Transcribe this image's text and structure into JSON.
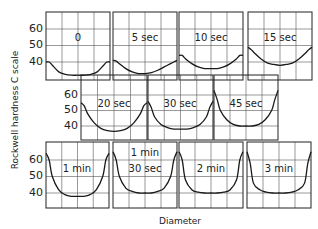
{
  "chart_data": {
    "type": "line",
    "title": "",
    "xlabel": "Diameter",
    "ylabel": "Rockwell hardness C scale",
    "y_ticks": [
      40,
      50,
      60
    ],
    "ylim": [
      30,
      70
    ],
    "grid": true,
    "x": [
      0,
      0.05,
      0.1,
      0.2,
      0.3,
      0.4,
      0.5,
      0.6,
      0.7,
      0.8,
      0.9,
      0.95,
      1.0
    ],
    "panels": [
      {
        "label": "0",
        "row": 0,
        "values": [
          40,
          40,
          38,
          34,
          32.5,
          32,
          32,
          32,
          32.5,
          34,
          38,
          40,
          40
        ]
      },
      {
        "label": "5 sec",
        "row": 0,
        "values": [
          41,
          40.5,
          39,
          36,
          34,
          33,
          33,
          33.5,
          35,
          37,
          39,
          40,
          41
        ]
      },
      {
        "label": "10 sec",
        "row": 0,
        "values": [
          44,
          44,
          42,
          39,
          37,
          36,
          36,
          36,
          37,
          39,
          42,
          44,
          44
        ]
      },
      {
        "label": "15 sec",
        "row": 0,
        "values": [
          49,
          47.5,
          45.5,
          42,
          39.5,
          38.5,
          38,
          38.5,
          39.5,
          42,
          45.5,
          47.5,
          49
        ]
      },
      {
        "label": "20 sec",
        "row": 1,
        "values": [
          55,
          53,
          48,
          42,
          38.5,
          37,
          36.5,
          37,
          38.5,
          42,
          48,
          53,
          55
        ]
      },
      {
        "label": "30 sec",
        "row": 1,
        "values": [
          56,
          52,
          46,
          41,
          39,
          38,
          38,
          38,
          39,
          41,
          46,
          52,
          56
        ]
      },
      {
        "label": "45 sec",
        "row": 1,
        "values": [
          63,
          57,
          50,
          44,
          41,
          40,
          40,
          40,
          41,
          44,
          50,
          57,
          63
        ]
      },
      {
        "label": "1 min",
        "row": 2,
        "values": [
          64,
          60,
          50,
          42,
          39,
          38,
          38,
          38,
          39,
          42,
          50,
          60,
          64
        ]
      },
      {
        "label": "1 min\n30 sec",
        "row": 2,
        "values": [
          65,
          60,
          50,
          43,
          41,
          40,
          40,
          40,
          41,
          43,
          50,
          60,
          65
        ]
      },
      {
        "label": "2 min",
        "row": 2,
        "values": [
          65,
          60,
          48,
          42,
          40.5,
          40,
          40,
          40,
          40.5,
          42,
          48,
          60,
          65
        ]
      },
      {
        "label": "3 min",
        "row": 2,
        "values": [
          65,
          58,
          46,
          42,
          40.5,
          40,
          40,
          40,
          40.5,
          42,
          46,
          58,
          65
        ]
      }
    ]
  },
  "axes": {
    "ylabel": "Rockwell hardness C scale",
    "xlabel": "Diameter",
    "tick_labels": [
      "60",
      "50",
      "40"
    ]
  },
  "panel_labels": {
    "p0": "0",
    "p1": "5 sec",
    "p2": "10 sec",
    "p3": "15 sec",
    "p4": "20 sec",
    "p5": "30 sec",
    "p6": "45 sec",
    "p7": "1 min",
    "p8_line1": "1 min",
    "p8_line2": "30 sec",
    "p9": "2 min",
    "p10": "3 min"
  },
  "colors": {
    "line": "#1a1a1a",
    "grid": "#555555",
    "frame": "#222222"
  }
}
